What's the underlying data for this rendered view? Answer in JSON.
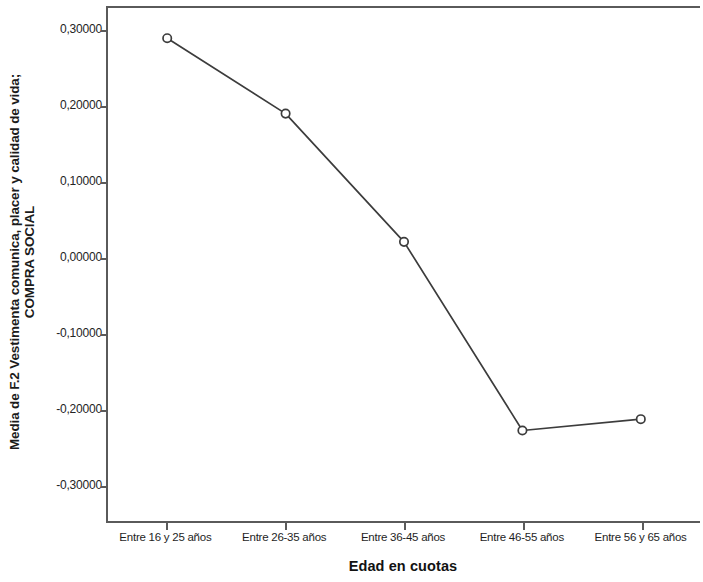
{
  "chart_data": {
    "type": "line",
    "title": "",
    "subtitle": "",
    "xlabel": "Edad en cuotas",
    "ylabel": "Media de F.2 Vestimenta comunica, placer y calidad de vida; COMPRA SOCIAL",
    "ylabel_line1": "Media de F.2 Vestimenta comunica, placer y calidad de vida;",
    "ylabel_line2": "COMPRA SOCIAL",
    "categories": [
      "Entre 16 y 25 años",
      "Entre 26-35 años",
      "Entre 36-45 años",
      "Entre 46-55 años",
      "Entre 56 y 65 años"
    ],
    "values": [
      0.29,
      0.19,
      0.02,
      -0.23,
      -0.215
    ],
    "ylim": [
      -0.35,
      0.33
    ],
    "yticks": [
      0.3,
      0.2,
      0.1,
      0.0,
      -0.1,
      -0.2,
      -0.3
    ],
    "ytick_labels": [
      "0,30000",
      "0,20000",
      "0,10000",
      "0,00000",
      "-0,10000",
      "-0,20000",
      "-0,30000"
    ],
    "grid": false,
    "legend": "none",
    "marker": "open-circle",
    "line_color": "#3c3c3c",
    "marker_color": "#3c3c3c",
    "axis_color": "#5a5a5a",
    "background": "#ffffff",
    "decimal_separator": ",",
    "points": [
      {
        "category": "Entre 16 y 25 años",
        "value": 0.29
      },
      {
        "category": "Entre 26-35 años",
        "value": 0.19
      },
      {
        "category": "Entre 36-45 años",
        "value": 0.02
      },
      {
        "category": "Entre 46-55 años",
        "value": -0.23
      },
      {
        "category": "Entre 56 y 65 años",
        "value": -0.215
      }
    ]
  }
}
